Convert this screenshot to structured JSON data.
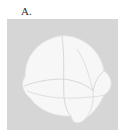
{
  "figure": {
    "panel_label": "A.",
    "background_color": "#d6d6d6",
    "object_color": "#f7f7f7",
    "edge_color": "#c8c8c8"
  }
}
